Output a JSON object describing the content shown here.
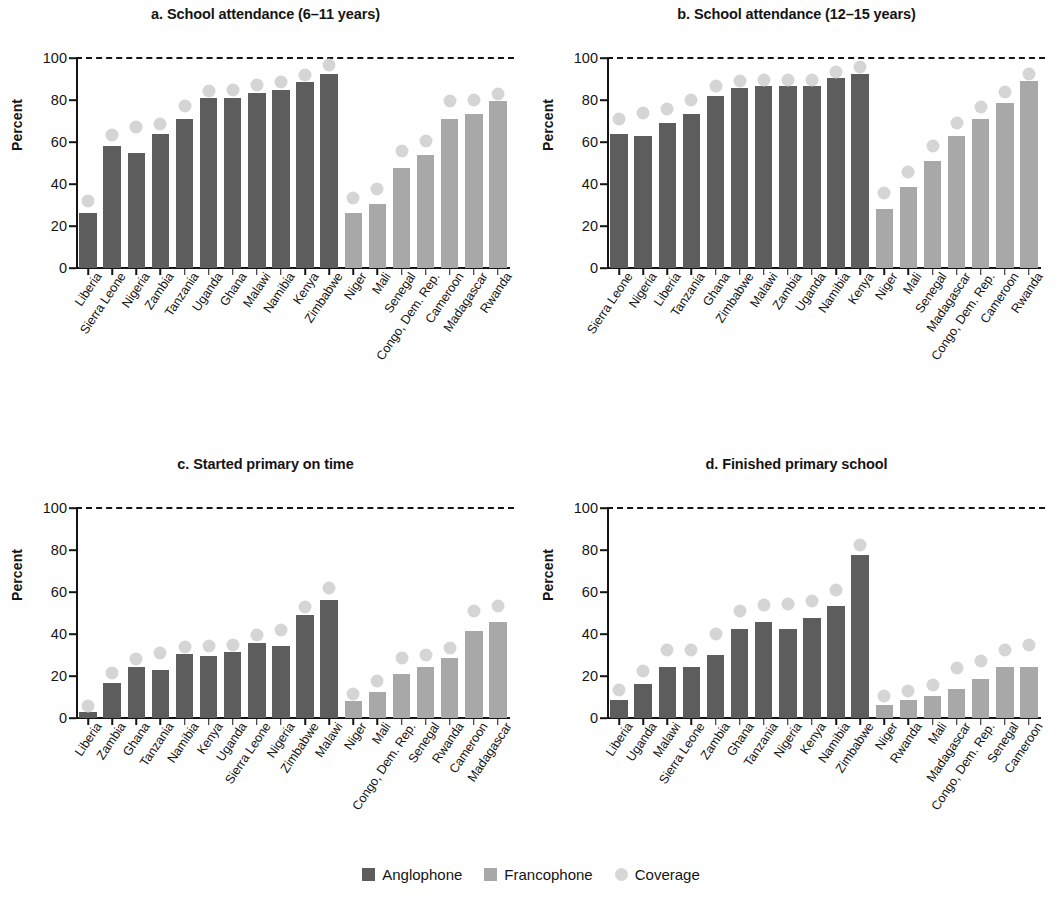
{
  "legend": {
    "anglophone": "Anglophone",
    "francophone": "Francophone",
    "coverage": "Coverage"
  },
  "colors": {
    "anglophone": "#5d5d5d",
    "francophone": "#a8a8a8",
    "coverage": "#d5d5d5",
    "axis": "#141414"
  },
  "axis": {
    "ylabel": "Percent",
    "yticks": [
      "0",
      "20",
      "40",
      "60",
      "80",
      "100"
    ],
    "ymin": 0,
    "ymax": 100
  },
  "chart_data": [
    {
      "type": "bar",
      "panel": "a",
      "title": "a. School attendance (6–11 years)",
      "xlabel": "",
      "ylabel": "Percent",
      "ylim": [
        0,
        100
      ],
      "grid": false,
      "reference_line": 100,
      "categories": [
        "Liberia",
        "Sierra Leone",
        "Nigeria",
        "Zambia",
        "Tanzania",
        "Uganda",
        "Ghana",
        "Malawi",
        "Namibia",
        "Kenya",
        "Zimbabwe",
        "Niger",
        "Mali",
        "Senegal",
        "Congo, Dem. Rep.",
        "Cameroon",
        "Madagascar",
        "Rwanda"
      ],
      "groups": [
        "Anglophone",
        "Anglophone",
        "Anglophone",
        "Anglophone",
        "Anglophone",
        "Anglophone",
        "Anglophone",
        "Anglophone",
        "Anglophone",
        "Anglophone",
        "Anglophone",
        "Francophone",
        "Francophone",
        "Francophone",
        "Francophone",
        "Francophone",
        "Francophone",
        "Francophone"
      ],
      "series": [
        {
          "name": "Attendance",
          "values": [
            26,
            58,
            55,
            64,
            71,
            81,
            81,
            83.5,
            85,
            88.5,
            92.5,
            26,
            30.5,
            47.5,
            54,
            71,
            73.5,
            79.5
          ]
        },
        {
          "name": "Coverage",
          "values": [
            32,
            63.5,
            67,
            68.5,
            77,
            84.5,
            85,
            87,
            88.5,
            92,
            96.5,
            33.5,
            37.5,
            55.5,
            60.5,
            79.5,
            80,
            83
          ]
        }
      ]
    },
    {
      "type": "bar",
      "panel": "b",
      "title": "b. School attendance (12–15 years)",
      "xlabel": "",
      "ylabel": "Percent",
      "ylim": [
        0,
        100
      ],
      "grid": false,
      "reference_line": 100,
      "categories": [
        "Sierra Leone",
        "Nigeria",
        "Liberia",
        "Tanzania",
        "Ghana",
        "Zimbabwe",
        "Malawi",
        "Zambia",
        "Uganda",
        "Namibia",
        "Kenya",
        "Niger",
        "Mali",
        "Senegal",
        "Madagascar",
        "Congo, Dem. Rep.",
        "Cameroon",
        "Rwanda"
      ],
      "groups": [
        "Anglophone",
        "Anglophone",
        "Anglophone",
        "Anglophone",
        "Anglophone",
        "Anglophone",
        "Anglophone",
        "Anglophone",
        "Anglophone",
        "Anglophone",
        "Anglophone",
        "Francophone",
        "Francophone",
        "Francophone",
        "Francophone",
        "Francophone",
        "Francophone",
        "Francophone"
      ],
      "series": [
        {
          "name": "Attendance",
          "values": [
            64,
            63,
            69,
            73.5,
            82,
            85.5,
            86.5,
            86.5,
            86.5,
            90.5,
            92.5,
            28,
            38.5,
            51,
            63,
            71,
            78.5,
            89
          ]
        },
        {
          "name": "Coverage",
          "values": [
            71,
            74,
            75.5,
            80,
            86.5,
            89,
            89.5,
            89.5,
            89.5,
            93.5,
            95.5,
            35.5,
            45.5,
            58,
            69,
            76.5,
            84,
            92.5
          ]
        }
      ]
    },
    {
      "type": "bar",
      "panel": "c",
      "title": "c. Started primary on time",
      "xlabel": "",
      "ylabel": "Percent",
      "ylim": [
        0,
        100
      ],
      "grid": false,
      "reference_line": 100,
      "categories": [
        "Liberia",
        "Zambia",
        "Ghana",
        "Tanzania",
        "Namibia",
        "Kenya",
        "Uganda",
        "Sierra Leone",
        "Nigeria",
        "Zimbabwe",
        "Malawi",
        "Niger",
        "Mali",
        "Congo, Dem. Rep.",
        "Senegal",
        "Rwanda",
        "Cameroon",
        "Madagascar"
      ],
      "groups": [
        "Anglophone",
        "Anglophone",
        "Anglophone",
        "Anglophone",
        "Anglophone",
        "Anglophone",
        "Anglophone",
        "Anglophone",
        "Anglophone",
        "Anglophone",
        "Anglophone",
        "Francophone",
        "Francophone",
        "Francophone",
        "Francophone",
        "Francophone",
        "Francophone",
        "Francophone"
      ],
      "series": [
        {
          "name": "Started on time",
          "values": [
            3,
            16.5,
            24.5,
            23,
            30.5,
            29.5,
            31.5,
            35.5,
            34.5,
            49,
            56,
            8,
            12.5,
            21,
            24.5,
            28.5,
            41.5,
            45.5
          ]
        },
        {
          "name": "Coverage",
          "values": [
            5.5,
            21.5,
            28,
            31,
            34,
            34.5,
            35,
            39.5,
            42,
            53,
            62,
            11.5,
            17.5,
            28.5,
            30,
            33.5,
            51,
            53.5
          ]
        }
      ]
    },
    {
      "type": "bar",
      "panel": "d",
      "title": "d. Finished primary school",
      "xlabel": "",
      "ylabel": "Percent",
      "ylim": [
        0,
        100
      ],
      "grid": false,
      "reference_line": 100,
      "categories": [
        "Liberia",
        "Uganda",
        "Malawi",
        "Sierra Leone",
        "Zambia",
        "Ghana",
        "Tanzania",
        "Nigeria",
        "Kenya",
        "Namibia",
        "Zimbabwe",
        "Niger",
        "Rwanda",
        "Mali",
        "Madagascar",
        "Congo, Dem. Rep.",
        "Senegal",
        "Cameroon"
      ],
      "groups": [
        "Anglophone",
        "Anglophone",
        "Anglophone",
        "Anglophone",
        "Anglophone",
        "Anglophone",
        "Anglophone",
        "Anglophone",
        "Anglophone",
        "Anglophone",
        "Anglophone",
        "Francophone",
        "Francophone",
        "Francophone",
        "Francophone",
        "Francophone",
        "Francophone",
        "Francophone"
      ],
      "series": [
        {
          "name": "Finished primary",
          "values": [
            8.5,
            16,
            24.5,
            24.5,
            30,
            42.5,
            45.5,
            42.5,
            47.5,
            53.5,
            77.5,
            6,
            8.5,
            10.5,
            14,
            18.5,
            24.5,
            24.5
          ]
        },
        {
          "name": "Coverage",
          "values": [
            13.5,
            22.5,
            32.5,
            32.5,
            40,
            51,
            54,
            54.5,
            55.5,
            61,
            82.5,
            10.5,
            13,
            15.5,
            24,
            27,
            32.5,
            35
          ]
        }
      ]
    }
  ]
}
